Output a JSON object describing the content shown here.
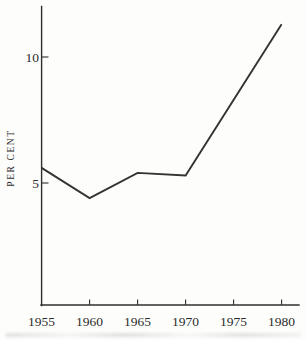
{
  "figure": {
    "background": "#fdfdfc",
    "line_color": "#333333",
    "axis_color": "#2f2f2f",
    "text_color": "#2b2b2b"
  },
  "chart_data": {
    "type": "line",
    "title": "",
    "xlabel": "",
    "ylabel": "PER CENT",
    "x": [
      1955,
      1960,
      1965,
      1970,
      1980
    ],
    "values": [
      5.6,
      4.4,
      5.4,
      5.3,
      11.3
    ],
    "series_name": "per-cent-rate",
    "x_tick_values": [
      1955,
      1960,
      1965,
      1970,
      1975,
      1980
    ],
    "x_ticks": [
      "1955",
      "1960",
      "1965",
      "1970",
      "1975",
      "1980"
    ],
    "y_tick_values": [
      5,
      10
    ],
    "y_ticks": [
      "5",
      "10"
    ],
    "xlim": [
      1955,
      1982
    ],
    "ylim": [
      0,
      12
    ],
    "grid": false,
    "legend": "none",
    "tick_direction": "inward"
  }
}
